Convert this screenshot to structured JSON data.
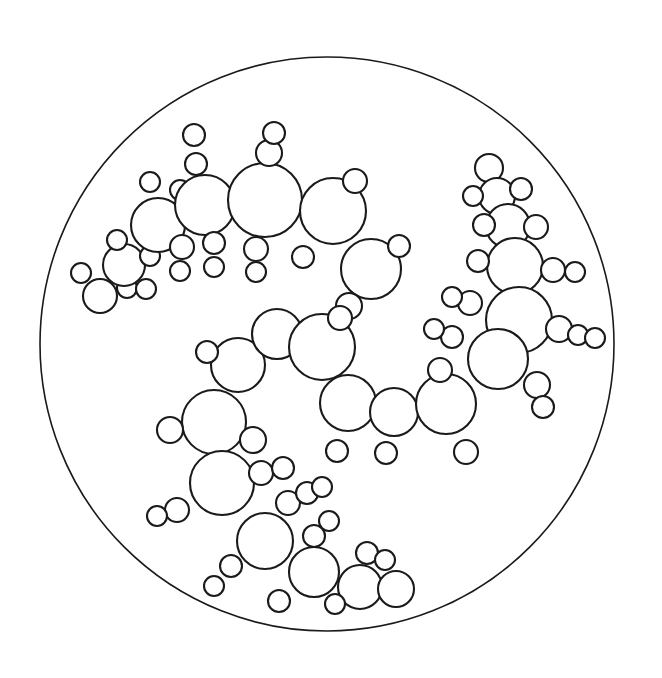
{
  "figure": {
    "type": "line-art-diagram",
    "canvas": {
      "width": 662,
      "height": 678,
      "background": "#ffffff"
    },
    "stroke_color": "#1a1a1a",
    "fill_color": "#ffffff",
    "boundary_stroke_width": 1.6,
    "circle_stroke_width": 2.1
  },
  "boundary": {
    "name": "bounding-circle",
    "cx": 327,
    "cy": 344,
    "r": 287
  },
  "clusters": [
    {
      "name": "upper-left-chain",
      "label": "Upper left branching chain",
      "circles": [
        {
          "cx": 100,
          "cy": 296,
          "r": 17
        },
        {
          "cx": 81,
          "cy": 273,
          "r": 10
        },
        {
          "cx": 127,
          "cy": 288,
          "r": 10
        },
        {
          "cx": 124,
          "cy": 265,
          "r": 21
        },
        {
          "cx": 117,
          "cy": 240,
          "r": 10
        },
        {
          "cx": 146,
          "cy": 289,
          "r": 10
        },
        {
          "cx": 150,
          "cy": 256,
          "r": 10
        },
        {
          "cx": 150,
          "cy": 182,
          "r": 10
        },
        {
          "cx": 158,
          "cy": 225,
          "r": 27
        },
        {
          "cx": 182,
          "cy": 247,
          "r": 12
        },
        {
          "cx": 180,
          "cy": 271,
          "r": 10
        },
        {
          "cx": 180,
          "cy": 190,
          "r": 10
        },
        {
          "cx": 205,
          "cy": 205,
          "r": 30
        },
        {
          "cx": 196,
          "cy": 164,
          "r": 11
        },
        {
          "cx": 194,
          "cy": 135,
          "r": 11
        },
        {
          "cx": 214,
          "cy": 243,
          "r": 11
        },
        {
          "cx": 214,
          "cy": 267,
          "r": 10
        },
        {
          "cx": 265,
          "cy": 200,
          "r": 37
        },
        {
          "cx": 269,
          "cy": 153,
          "r": 13
        },
        {
          "cx": 274,
          "cy": 133,
          "r": 11
        },
        {
          "cx": 256,
          "cy": 249,
          "r": 12
        },
        {
          "cx": 256,
          "cy": 272,
          "r": 10
        },
        {
          "cx": 333,
          "cy": 211,
          "r": 33
        },
        {
          "cx": 355,
          "cy": 181,
          "r": 12
        },
        {
          "cx": 303,
          "cy": 257,
          "r": 11
        },
        {
          "cx": 371,
          "cy": 269,
          "r": 30
        },
        {
          "cx": 399,
          "cy": 246,
          "r": 11
        },
        {
          "cx": 349,
          "cy": 306,
          "r": 13
        }
      ]
    },
    {
      "name": "upper-right-chain",
      "label": "Upper right vertical branching chain",
      "circles": [
        {
          "cx": 489,
          "cy": 168,
          "r": 14
        },
        {
          "cx": 497,
          "cy": 196,
          "r": 18
        },
        {
          "cx": 473,
          "cy": 196,
          "r": 10
        },
        {
          "cx": 521,
          "cy": 189,
          "r": 11
        },
        {
          "cx": 508,
          "cy": 226,
          "r": 22
        },
        {
          "cx": 484,
          "cy": 225,
          "r": 11
        },
        {
          "cx": 536,
          "cy": 227,
          "r": 12
        },
        {
          "cx": 515,
          "cy": 266,
          "r": 28
        },
        {
          "cx": 478,
          "cy": 261,
          "r": 11
        },
        {
          "cx": 553,
          "cy": 270,
          "r": 12
        },
        {
          "cx": 575,
          "cy": 272,
          "r": 10
        },
        {
          "cx": 519,
          "cy": 320,
          "r": 33
        },
        {
          "cx": 470,
          "cy": 303,
          "r": 12
        },
        {
          "cx": 452,
          "cy": 297,
          "r": 10
        },
        {
          "cx": 559,
          "cy": 329,
          "r": 13
        },
        {
          "cx": 578,
          "cy": 335,
          "r": 10
        },
        {
          "cx": 595,
          "cy": 338,
          "r": 10
        },
        {
          "cx": 498,
          "cy": 359,
          "r": 30
        },
        {
          "cx": 452,
          "cy": 337,
          "r": 11
        },
        {
          "cx": 434,
          "cy": 329,
          "r": 10
        },
        {
          "cx": 537,
          "cy": 385,
          "r": 13
        },
        {
          "cx": 543,
          "cy": 407,
          "r": 11
        }
      ]
    },
    {
      "name": "center-spiral-chain",
      "label": "Central spiral chain of large circles",
      "circles": [
        {
          "cx": 238,
          "cy": 365,
          "r": 27
        },
        {
          "cx": 207,
          "cy": 352,
          "r": 11
        },
        {
          "cx": 277,
          "cy": 334,
          "r": 25
        },
        {
          "cx": 322,
          "cy": 347,
          "r": 33
        },
        {
          "cx": 348,
          "cy": 403,
          "r": 28
        },
        {
          "cx": 340,
          "cy": 318,
          "r": 12
        },
        {
          "cx": 337,
          "cy": 451,
          "r": 11
        },
        {
          "cx": 394,
          "cy": 412,
          "r": 24
        },
        {
          "cx": 386,
          "cy": 453,
          "r": 11
        },
        {
          "cx": 446,
          "cy": 404,
          "r": 30
        },
        {
          "cx": 440,
          "cy": 370,
          "r": 12
        },
        {
          "cx": 466,
          "cy": 452,
          "r": 12
        },
        {
          "cx": 214,
          "cy": 422,
          "r": 32
        },
        {
          "cx": 170,
          "cy": 430,
          "r": 13
        },
        {
          "cx": 253,
          "cy": 440,
          "r": 13
        },
        {
          "cx": 222,
          "cy": 483,
          "r": 32
        },
        {
          "cx": 177,
          "cy": 510,
          "r": 12
        },
        {
          "cx": 157,
          "cy": 516,
          "r": 10
        },
        {
          "cx": 261,
          "cy": 473,
          "r": 12
        },
        {
          "cx": 283,
          "cy": 468,
          "r": 11
        }
      ]
    },
    {
      "name": "lower-center-chain",
      "label": "Lower center descending chain",
      "circles": [
        {
          "cx": 265,
          "cy": 541,
          "r": 28
        },
        {
          "cx": 288,
          "cy": 503,
          "r": 12
        },
        {
          "cx": 307,
          "cy": 493,
          "r": 11
        },
        {
          "cx": 322,
          "cy": 487,
          "r": 10
        },
        {
          "cx": 231,
          "cy": 566,
          "r": 11
        },
        {
          "cx": 214,
          "cy": 586,
          "r": 10
        },
        {
          "cx": 314,
          "cy": 572,
          "r": 25
        },
        {
          "cx": 314,
          "cy": 536,
          "r": 11
        },
        {
          "cx": 329,
          "cy": 521,
          "r": 10
        },
        {
          "cx": 279,
          "cy": 601,
          "r": 11
        },
        {
          "cx": 360,
          "cy": 587,
          "r": 22
        },
        {
          "cx": 367,
          "cy": 553,
          "r": 11
        },
        {
          "cx": 335,
          "cy": 604,
          "r": 10
        },
        {
          "cx": 396,
          "cy": 589,
          "r": 18
        },
        {
          "cx": 385,
          "cy": 560,
          "r": 10
        }
      ]
    }
  ]
}
